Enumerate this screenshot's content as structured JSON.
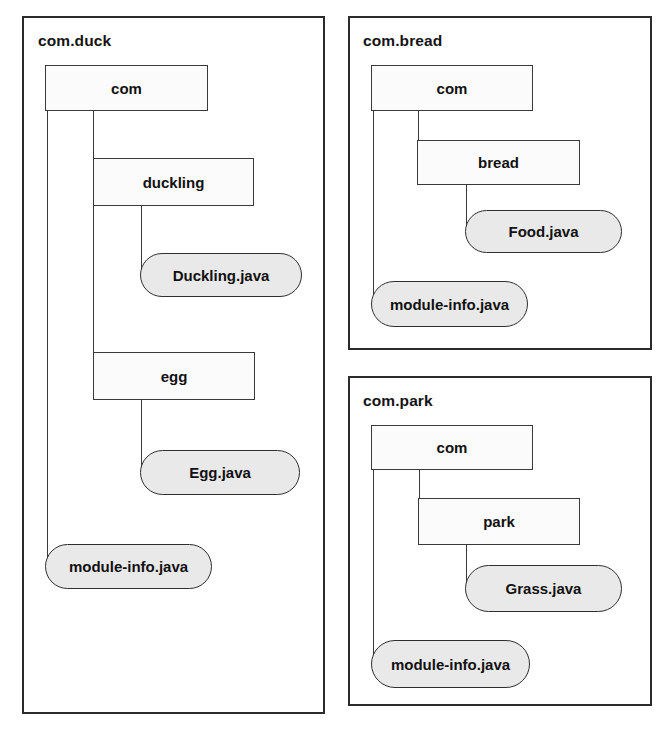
{
  "diagram": {
    "colors": {
      "panel_border": "#2b2b2b",
      "box_border": "#3a3a3a",
      "dir_fill": "#fbfbfb",
      "file_fill": "#e9e9e9",
      "text": "#111111",
      "background": "#ffffff"
    }
  },
  "modules": [
    {
      "id": "com-duck",
      "name": "com.duck",
      "directories": [
        {
          "id": "duck-com",
          "label": "com"
        },
        {
          "id": "duck-duckling",
          "label": "duckling"
        },
        {
          "id": "duck-egg",
          "label": "egg"
        }
      ],
      "files": [
        {
          "id": "duck-duckling-java",
          "label": "Duckling.java"
        },
        {
          "id": "duck-egg-java",
          "label": "Egg.java"
        },
        {
          "id": "duck-module-info",
          "label": "module-info.java"
        }
      ]
    },
    {
      "id": "com-bread",
      "name": "com.bread",
      "directories": [
        {
          "id": "bread-com",
          "label": "com"
        },
        {
          "id": "bread-bread",
          "label": "bread"
        }
      ],
      "files": [
        {
          "id": "bread-food-java",
          "label": "Food.java"
        },
        {
          "id": "bread-module-info",
          "label": "module-info.java"
        }
      ]
    },
    {
      "id": "com-park",
      "name": "com.park",
      "directories": [
        {
          "id": "park-com",
          "label": "com"
        },
        {
          "id": "park-park",
          "label": "park"
        }
      ],
      "files": [
        {
          "id": "park-grass-java",
          "label": "Grass.java"
        },
        {
          "id": "park-module-info",
          "label": "module-info.java"
        }
      ]
    }
  ]
}
